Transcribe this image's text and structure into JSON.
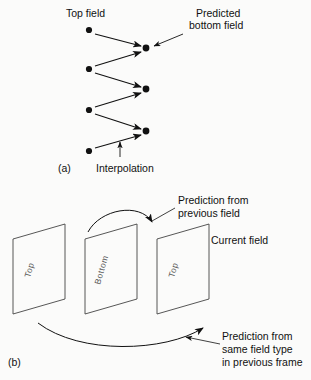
{
  "figure": {
    "panel_a": {
      "caption": "(a)",
      "labels": {
        "top_field": "Top field",
        "predicted_l1": "Predicted",
        "predicted_l2": "bottom field",
        "interpolation": "Interpolation"
      },
      "top_field_dots": [
        {
          "x": 89,
          "y": 30
        },
        {
          "x": 89,
          "y": 69
        },
        {
          "x": 89,
          "y": 110
        },
        {
          "x": 89,
          "y": 151
        }
      ],
      "predicted_dots": [
        {
          "x": 146,
          "y": 48
        },
        {
          "x": 146,
          "y": 89
        },
        {
          "x": 146,
          "y": 131
        }
      ],
      "icons": [
        "arrow-icon",
        "dot-marker-icon",
        "leader-line-icon"
      ]
    },
    "panel_b": {
      "caption": "(b)",
      "labels": {
        "prediction_prev_l1": "Prediction from",
        "prediction_prev_l2": "previous field",
        "current_field": "Current field",
        "prediction_same_l1": "Prediction from",
        "prediction_same_l2": "same field type",
        "prediction_same_l3": "in previous frame"
      },
      "planes": [
        {
          "label": "Top",
          "order": 1
        },
        {
          "label": "Bottom",
          "order": 2
        },
        {
          "label": "Top",
          "order": 3
        }
      ],
      "icons": [
        "curved-arrow-icon",
        "leader-line-icon",
        "plane-icon"
      ]
    }
  },
  "colors": {
    "ink": "#111111",
    "plane_stroke": "#444444",
    "field_label": "#555555",
    "background": "#fbfbfa"
  }
}
